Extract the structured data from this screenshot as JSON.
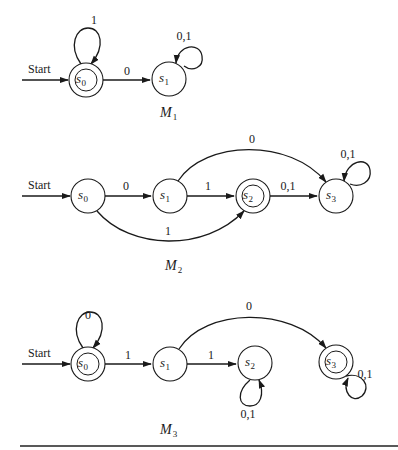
{
  "machines": [
    {
      "id": "M1",
      "label": {
        "main": "M",
        "sub": "1",
        "x": 160,
        "y": 117
      },
      "start": {
        "text": "Start",
        "x1": 22,
        "x2": 68,
        "y": 80,
        "text_x": 28,
        "text_y": 73
      },
      "states": [
        {
          "name": "s0",
          "base": "s",
          "sub": "0",
          "cx": 86,
          "cy": 80,
          "r": 17,
          "accepting": true
        },
        {
          "name": "s1",
          "base": "s",
          "sub": "1",
          "cx": 169,
          "cy": 79,
          "r": 17,
          "accepting": false
        }
      ],
      "edges": [
        {
          "from": "s0",
          "to": "s1",
          "path": "M103,80 L150,80",
          "label": "0",
          "lx": 127,
          "ly": 75
        }
      ],
      "loops": [
        {
          "state": "s0",
          "path": "M81,64 C68,46 76,28 88,28 C101,28 106,46 91,64",
          "label": "1",
          "lx": 94,
          "ly": 24
        },
        {
          "state": "s1",
          "path": "M176,63 C178,44 200,42 202,56 C204,68 192,72 184,66",
          "label": "0,1",
          "lx": 184,
          "ly": 40,
          "arrow_at_start": true
        }
      ]
    },
    {
      "id": "M2",
      "label": {
        "main": "M",
        "sub": "2",
        "x": 165,
        "y": 270
      },
      "start": {
        "text": "Start",
        "x1": 22,
        "x2": 70,
        "y": 196,
        "text_x": 28,
        "text_y": 189
      },
      "states": [
        {
          "name": "s0",
          "base": "s",
          "sub": "0",
          "cx": 88,
          "cy": 196,
          "r": 17,
          "accepting": false
        },
        {
          "name": "s1",
          "base": "s",
          "sub": "1",
          "cx": 170,
          "cy": 196,
          "r": 17,
          "accepting": false
        },
        {
          "name": "s2",
          "base": "s",
          "sub": "2",
          "cx": 253,
          "cy": 196,
          "r": 17,
          "accepting": true
        },
        {
          "name": "s3",
          "base": "s",
          "sub": "3",
          "cx": 336,
          "cy": 196,
          "r": 17,
          "accepting": false
        }
      ],
      "edges": [
        {
          "from": "s0",
          "to": "s1",
          "path": "M105,196 L151,196",
          "label": "0",
          "lx": 126,
          "ly": 190
        },
        {
          "from": "s1",
          "to": "s2",
          "path": "M187,196 L234,196",
          "label": "1",
          "lx": 208,
          "ly": 190
        },
        {
          "from": "s2",
          "to": "s3",
          "path": "M270,196 L317,196",
          "label": "0,1",
          "lx": 288,
          "ly": 190
        },
        {
          "from": "s1",
          "to": "s3",
          "path": "M178,181 C205,140 290,138 326,182",
          "label": "0",
          "lx": 252,
          "ly": 143
        },
        {
          "from": "s0",
          "to": "s2",
          "path": "M97,211 C130,250 205,252 244,211",
          "label": "1",
          "lx": 168,
          "ly": 235
        }
      ],
      "loops": [
        {
          "state": "s3",
          "path": "M344,181 C346,160 368,156 370,170 C372,182 360,188 350,184",
          "label": "0,1",
          "lx": 348,
          "ly": 158,
          "arrow_at_start": true
        }
      ]
    },
    {
      "id": "M3",
      "label": {
        "main": "M",
        "sub": "3",
        "x": 160,
        "y": 434
      },
      "start": {
        "text": "Start",
        "x1": 22,
        "x2": 70,
        "y": 364,
        "text_x": 28,
        "text_y": 357
      },
      "states": [
        {
          "name": "s0",
          "base": "s",
          "sub": "0",
          "cx": 88,
          "cy": 364,
          "r": 17,
          "accepting": true
        },
        {
          "name": "s1",
          "base": "s",
          "sub": "1",
          "cx": 170,
          "cy": 364,
          "r": 17,
          "accepting": false
        },
        {
          "name": "s2",
          "base": "s",
          "sub": "2",
          "cx": 255,
          "cy": 363,
          "r": 17,
          "accepting": false
        },
        {
          "name": "s3",
          "base": "s",
          "sub": "3",
          "cx": 336,
          "cy": 362,
          "r": 17,
          "accepting": true
        }
      ],
      "edges": [
        {
          "from": "s0",
          "to": "s1",
          "path": "M105,364 L151,364",
          "label": "1",
          "lx": 128,
          "ly": 359
        },
        {
          "from": "s1",
          "to": "s2",
          "path": "M187,364 L236,364",
          "label": "1",
          "lx": 211,
          "ly": 359
        },
        {
          "from": "s1",
          "to": "s3",
          "path": "M179,349 C205,308 290,306 326,348",
          "label": "0",
          "lx": 249,
          "ly": 310
        }
      ],
      "loops": [
        {
          "state": "s0",
          "path": "M83,348 C70,330 78,312 90,312 C103,312 108,330 93,348",
          "label": "0",
          "lx": 88,
          "ly": 319
        },
        {
          "state": "s2",
          "path": "M259,380 C265,395 260,406 250,406 C238,406 236,392 250,380",
          "label": "0,1",
          "lx": 248,
          "ly": 418,
          "arrow_at_start": true
        },
        {
          "state": "s3",
          "path": "M346,376 C362,372 372,386 362,396 C352,404 342,392 348,378",
          "label": "0,1",
          "lx": 365,
          "ly": 378
        }
      ]
    }
  ],
  "rule": {
    "x1": 20,
    "x2": 398,
    "y": 446
  },
  "colors": {
    "ink": "#1a1a1a",
    "background": "#ffffff"
  }
}
